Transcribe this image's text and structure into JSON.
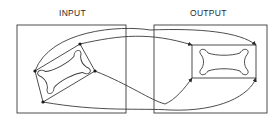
{
  "diagram": {
    "input_label": "INPUT",
    "output_label": "OUTPUT",
    "stroke_color": "#3a3a3a",
    "background": "#ffffff"
  }
}
